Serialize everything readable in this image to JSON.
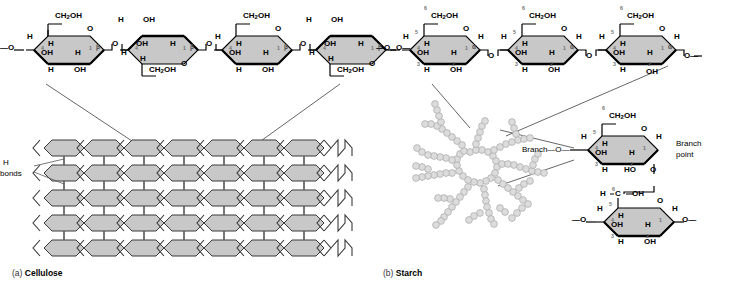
{
  "figure": {
    "panels": [
      {
        "tag": "(a)",
        "name": "Cellulose"
      },
      {
        "tag": "(b)",
        "name": "Starch"
      }
    ]
  },
  "labels": {
    "h_bonds_line1": "H",
    "h_bonds_line2": "bonds",
    "branch": "Branch",
    "branch_point_line1": "Branch",
    "branch_point_line2": "point",
    "bond_dash": "—",
    "terminal_o": "O"
  },
  "chemistry": {
    "atoms": {
      "ch2oh": "CH2OH",
      "ch2oh_pre": "CH",
      "ch2oh_sub": "2",
      "ch2oh_post": "OH",
      "oh": "OH",
      "ho": "HO",
      "h": "H",
      "o": "O",
      "c": "C"
    },
    "linkages": {
      "beta": "β",
      "alpha": "α"
    },
    "carbon_numbers": [
      "1",
      "2",
      "3",
      "4",
      "5",
      "6"
    ]
  },
  "cellulose": {
    "linkage_symbol": "β",
    "ring_count": 4,
    "orientation_pattern": [
      "up",
      "down",
      "up",
      "down"
    ],
    "ring_up_labels": {
      "c6": "CH2OH",
      "c4_h": "H",
      "c5_h": "H",
      "c3_oh": "OH",
      "c2_h": "H",
      "c3_h": "H",
      "c2_oh": "OH",
      "ring_o": "O",
      "c1_h": "H"
    },
    "ring_down_labels": {
      "c6": "CH2OH",
      "c4_h": "H",
      "c5_h": "H",
      "c3_oh": "OH",
      "c2_h": "H",
      "c3_h": "H",
      "c2_oh": "OH",
      "ring_o": "O",
      "c1_h": "H"
    },
    "left_terminal": "—O—",
    "right_terminal": "—O—",
    "microfibril": {
      "rows": 5,
      "cols": 7,
      "trailing_zigzags": 3
    }
  },
  "starch": {
    "linkage_symbol": "α",
    "top_ring_count": 3,
    "ring_labels": {
      "c6": "CH2OH",
      "c5_h": "H",
      "c4_h": "H",
      "c3_oh": "OH",
      "c2_h": "H",
      "c3_h": "H",
      "c2_oh": "OH",
      "ring_o": "O",
      "c1_h": "H"
    },
    "branch_ring": {
      "c6": "CH2OH",
      "c4_label": "Branch—O—",
      "c2_ho": "HO",
      "c3_h": "H",
      "c1_o": "O",
      "branch_point_label": "Branch point"
    },
    "lower_ring": {
      "c6_left_h": "H",
      "c6_c": "C",
      "c6_oh": "OH",
      "c5_h": "H",
      "c4_h": "H",
      "c3_oh": "OH",
      "c2_h": "H",
      "c3_h": "H",
      "c2_oh": "OH",
      "ring_o": "O",
      "c1_h": "H",
      "left_terminal": "—O—",
      "right_terminal": "—O—"
    },
    "amylopectin": {
      "description": "branched bead chain",
      "bead_color": "#d9d9d9"
    }
  },
  "colors": {
    "ring_fill": "#c8c8c8",
    "ring_stroke": "#000000",
    "bead_fill": "#dcdcdc",
    "bead_stroke": "#a8a8a8",
    "leader_line": "#555555",
    "text": "#000000",
    "carbon_number": "#6f6f6f",
    "background": "#ffffff"
  }
}
